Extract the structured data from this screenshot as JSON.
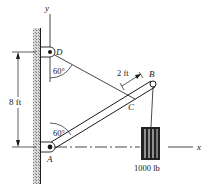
{
  "labels": {
    "y_axis": "y",
    "x_axis": "x",
    "point_d": "D",
    "point_b": "B",
    "point_c": "C",
    "point_a": "A",
    "angle_d": "60°",
    "angle_a": "60°",
    "dim_height": "8 ft",
    "dim_bc": "2 ft",
    "weight": "1000 lb"
  },
  "colors": {
    "ink": "#1a1a1a",
    "wall": "#9a9a9a"
  }
}
